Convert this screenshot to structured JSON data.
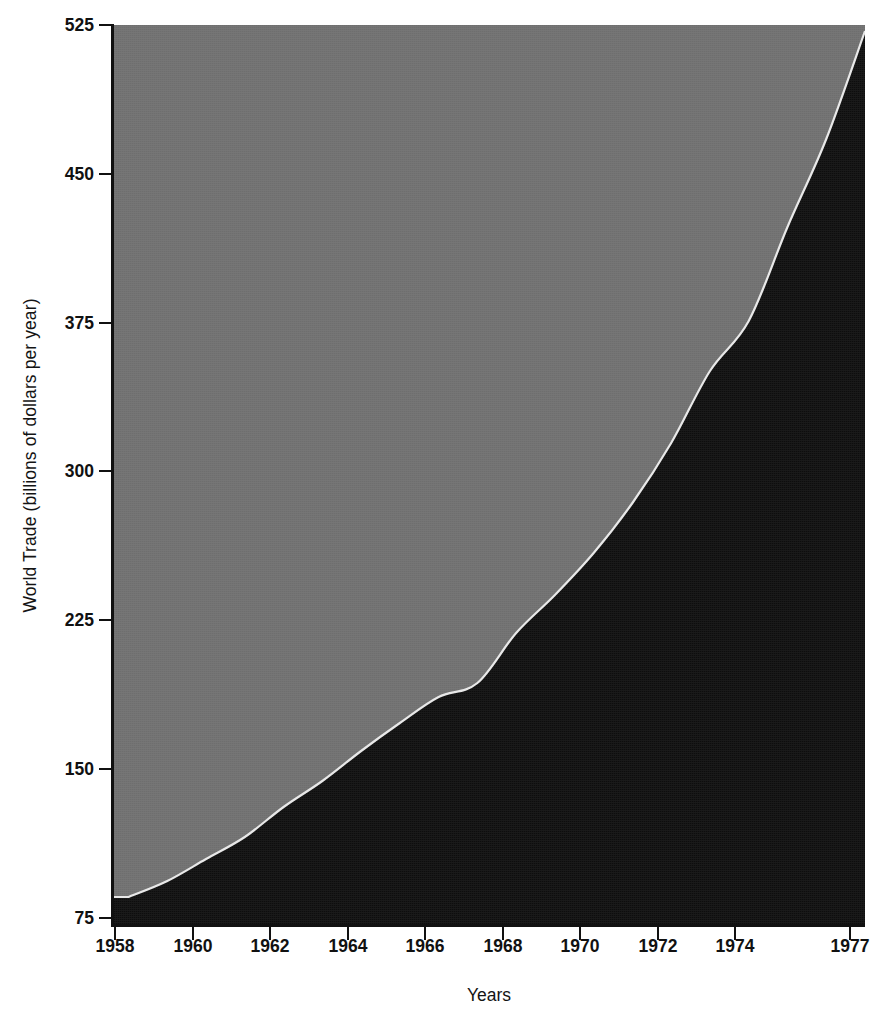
{
  "chart_data": {
    "type": "area",
    "title": "",
    "subtitle": "",
    "xlabel": "Years",
    "ylabel": "World Trade (billions of dollars per year)",
    "x_tick_labels": [
      "1958",
      "1960",
      "1962",
      "1964",
      "1966",
      "1968",
      "1970",
      "1972",
      "1974",
      "1977"
    ],
    "y_tick_labels": [
      "525",
      "450",
      "375",
      "300",
      "225",
      "150",
      "75"
    ],
    "xlim": [
      1957.6,
      1977.0
    ],
    "ylim": [
      75,
      525
    ],
    "grid": false,
    "legend": "none",
    "x": [
      1958,
      1959,
      1960,
      1961,
      1962,
      1963,
      1964,
      1965,
      1966,
      1967,
      1968,
      1969,
      1970,
      1971,
      1972,
      1973,
      1974,
      1975,
      1976,
      1977
    ],
    "series": [
      {
        "name": "World Trade",
        "color": "#0d0d0d",
        "values": [
          89,
          97,
          108,
          119,
          134,
          147,
          162,
          176,
          189,
          196,
          221,
          240,
          261,
          286,
          316,
          352,
          377,
          424,
          468,
          522
        ]
      }
    ],
    "background_region": {
      "name": "plot-background",
      "color": "#6e6e6e",
      "top_value": 525
    }
  },
  "axis": {
    "x_ticks": [
      {
        "label": "1958",
        "px": 115
      },
      {
        "label": "1960",
        "px": 193
      },
      {
        "label": "1962",
        "px": 270
      },
      {
        "label": "1964",
        "px": 348
      },
      {
        "label": "1966",
        "px": 425
      },
      {
        "label": "1968",
        "px": 503
      },
      {
        "label": "1970",
        "px": 580
      },
      {
        "label": "1972",
        "px": 658
      },
      {
        "label": "1974",
        "px": 735
      },
      {
        "label": "1977",
        "px": 850
      }
    ],
    "y_ticks": [
      {
        "label": "525",
        "px": 25
      },
      {
        "label": "450",
        "px": 174
      },
      {
        "label": "375",
        "px": 323
      },
      {
        "label": "300",
        "px": 471
      },
      {
        "label": "225",
        "px": 620
      },
      {
        "label": "150",
        "px": 769
      },
      {
        "label": "75",
        "px": 918
      }
    ]
  },
  "colors": {
    "area_fill": "#0d0d0d",
    "background_fill": "#6e6e6e",
    "boundary_line": "#e8e8e8",
    "axis": "#111111",
    "page": "#ffffff"
  }
}
